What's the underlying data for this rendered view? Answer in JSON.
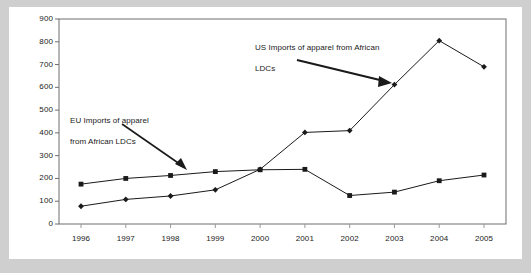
{
  "figure": {
    "background_color": "#ffffff",
    "frame_color": "#cfcfcf",
    "line_color": "#1a1a1a",
    "text_color": "#1a1a1a"
  },
  "annotations": {
    "eu": {
      "text": "EU Imports of apparel\nfrom African LDCs",
      "line1": "EU Imports of apparel",
      "line2": "from African LDCs"
    },
    "us": {
      "text": "US Imports of apparel from African\nLDCs",
      "line1": "US Imports of apparel from African",
      "line2": "LDCs"
    }
  },
  "chart_data": {
    "type": "line",
    "title": "",
    "subtitle": "",
    "xlabel": "",
    "ylabel": "",
    "grid": false,
    "legend_position": "annotations",
    "categories": [
      "1996",
      "1997",
      "1998",
      "1999",
      "2000",
      "2001",
      "2002",
      "2003",
      "2004",
      "2005"
    ],
    "x": [
      1996,
      1997,
      1998,
      1999,
      2000,
      2001,
      2002,
      2003,
      2004,
      2005
    ],
    "xlim": [
      1996,
      2005
    ],
    "ylim": [
      0,
      900
    ],
    "yticks": [
      0,
      100,
      200,
      300,
      400,
      500,
      600,
      700,
      800,
      900
    ],
    "ytick_labels": [
      "0",
      "100",
      "200",
      "300",
      "400",
      "500",
      "600",
      "700",
      "800",
      "900"
    ],
    "series": [
      {
        "name": "EU Imports of apparel from African LDCs",
        "marker": "square",
        "color": "#1a1a1a",
        "values": [
          175,
          200,
          213,
          230,
          238,
          240,
          125,
          140,
          190,
          215
        ]
      },
      {
        "name": "US Imports of apparel from African LDCs",
        "marker": "diamond",
        "color": "#1a1a1a",
        "values": [
          78,
          108,
          123,
          150,
          240,
          402,
          410,
          612,
          805,
          690
        ]
      }
    ]
  }
}
